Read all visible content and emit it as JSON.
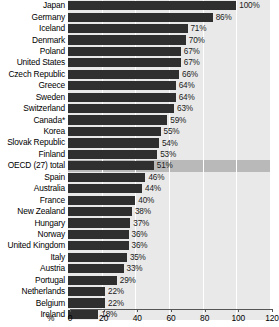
{
  "chart_data": {
    "type": "bar",
    "title": "",
    "subtitle": "",
    "xlabel": "%",
    "ylabel": "",
    "orientation": "horizontal",
    "xlim": [
      0,
      120
    ],
    "xticks": [
      0,
      20,
      40,
      60,
      80,
      100,
      120
    ],
    "xtick_labels": [
      "0",
      "20",
      "40",
      "60",
      "80",
      "100",
      "120"
    ],
    "grid": "vertical",
    "legend": "none",
    "value_suffix": "%",
    "highlight_category": "OECD (27) total",
    "categories": [
      "Japan",
      "Germany",
      "Iceland",
      "Denmark",
      "Poland",
      "United States",
      "Czech Republic",
      "Greece",
      "Sweden",
      "Switzerland",
      "Canada*",
      "Korea",
      "Slovak Republic",
      "Finland",
      "OECD (27) total",
      "Spain",
      "Australia",
      "France",
      "New Zealand",
      "Hungary",
      "Norway",
      "United Kingdom",
      "Italy",
      "Austria",
      "Portugal",
      "Netherlands",
      "Belgium",
      "Ireland"
    ],
    "values": [
      100,
      86,
      71,
      70,
      67,
      67,
      66,
      64,
      64,
      63,
      59,
      55,
      54,
      53,
      51,
      46,
      44,
      40,
      38,
      37,
      36,
      36,
      35,
      33,
      29,
      22,
      22,
      18
    ],
    "value_labels": [
      "100%",
      "86%",
      "71%",
      "70%",
      "67%",
      "67%",
      "66%",
      "64%",
      "64%",
      "63%",
      "59%",
      "55%",
      "54%",
      "53%",
      "51%",
      "46%",
      "44%",
      "40%",
      "38%",
      "37%",
      "36%",
      "36%",
      "35%",
      "33%",
      "29%",
      "22%",
      "22%",
      "18%"
    ]
  },
  "colors": {
    "bar": "#2f2f2f",
    "track": "#e9e9e9",
    "track_highlight": "#b9b9b9",
    "axis": "#555555",
    "text": "#000000",
    "background": "#ffffff"
  }
}
